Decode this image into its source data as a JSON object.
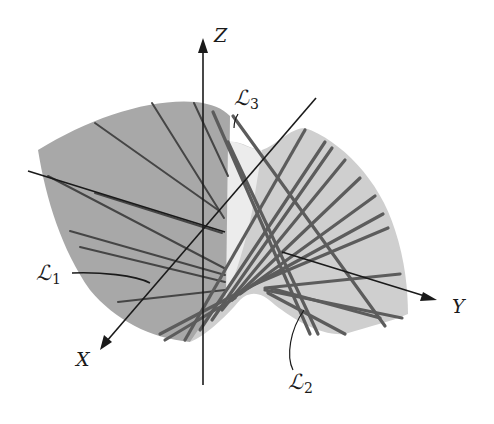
{
  "figure": {
    "colors": {
      "background": "#ffffff",
      "surface_back": "#a6a6a6",
      "surface_front": "#d0d0d0",
      "surface_highlight": "#ececec",
      "ruling_back": "#404040",
      "ruling_front": "#5e5e5e",
      "axis": "#1a1a1a"
    },
    "axes": {
      "x": {
        "label": "X"
      },
      "y": {
        "label": "Y"
      },
      "z": {
        "label": "Z"
      }
    },
    "annotations": [
      {
        "id": "L1",
        "script": "ℒ",
        "subscript": "1"
      },
      {
        "id": "L2",
        "script": "ℒ",
        "subscript": "2"
      },
      {
        "id": "L3",
        "script": "ℒ",
        "subscript": "3"
      }
    ]
  }
}
